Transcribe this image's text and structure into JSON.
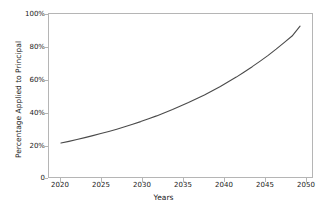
{
  "chart_data": {
    "type": "line",
    "title": "",
    "xlabel": "Years",
    "ylabel": "Percentage Applied to Principal",
    "xlim": [
      2018.5,
      2051.5
    ],
    "ylim": [
      0,
      108
    ],
    "grid": false,
    "legend": null,
    "xticks": [
      "2020",
      "2025",
      "2030",
      "2035",
      "2040",
      "2045",
      "2050"
    ],
    "xtick_values": [
      2020,
      2025,
      2030,
      2035,
      2040,
      2045,
      2050
    ],
    "yticks": [
      "0",
      "20%",
      "40%",
      "60%",
      "80%",
      "100%"
    ],
    "ytick_values": [
      0,
      20,
      40,
      60,
      80,
      100
    ],
    "line_color": "#4a4a4a",
    "line_width": 1.1,
    "series": [
      {
        "name": "Percentage Applied to Principal",
        "x": [
          2020,
          2021,
          2022,
          2023,
          2024,
          2025,
          2026,
          2027,
          2028,
          2029,
          2030,
          2031,
          2032,
          2033,
          2034,
          2035,
          2036,
          2037,
          2038,
          2039,
          2040,
          2041,
          2042,
          2043,
          2044,
          2045,
          2046,
          2047,
          2048,
          2049,
          2050
        ],
        "values": [
          22.5,
          23.6,
          24.8,
          26.1,
          27.4,
          28.8,
          30.2,
          31.7,
          33.3,
          35.0,
          36.7,
          38.6,
          40.5,
          42.6,
          44.7,
          47.0,
          49.3,
          51.8,
          54.4,
          57.2,
          60.0,
          63.1,
          66.2,
          69.6,
          73.1,
          76.8,
          80.6,
          84.7,
          89.0,
          93.4,
          100.0
        ]
      }
    ]
  }
}
